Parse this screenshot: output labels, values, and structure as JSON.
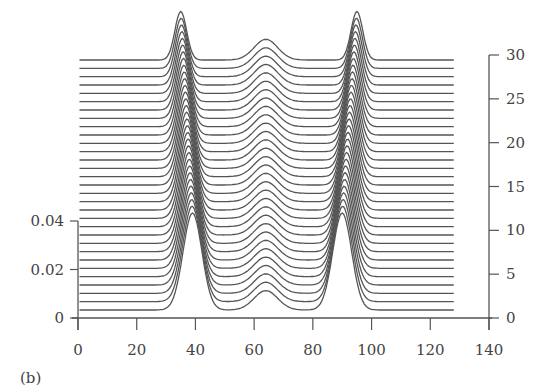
{
  "panel_label": "(b)",
  "chart_data": {
    "type": "line",
    "subtype": "waterfall",
    "title": "",
    "xlabel": "",
    "ylabel": "",
    "zlabel": "",
    "xlim": [
      0,
      140
    ],
    "x_ticks": [
      0,
      20,
      40,
      60,
      80,
      100,
      120,
      140
    ],
    "x_data_range": [
      0,
      128
    ],
    "ylim": [
      0,
      0.04
    ],
    "y_ticks": [
      "0",
      "0.02",
      "0.04"
    ],
    "zlim": [
      0,
      30
    ],
    "z_ticks": [
      0,
      5,
      10,
      15,
      20,
      25,
      30
    ],
    "grid": false,
    "legend": null,
    "n_traces": 31,
    "trace_offset_per_step": 1,
    "peaks": {
      "left": {
        "center_start": 39,
        "center_end": 35,
        "height_start": 0.04,
        "height_end": 0.02,
        "width_start": 3.2,
        "width_end": 2.0
      },
      "center": {
        "center": 64,
        "height_start": 0.008,
        "height_end": 0.0085,
        "width": 4.0
      },
      "right": {
        "center_start": 90,
        "center_end": 95,
        "height_start": 0.04,
        "height_end": 0.02,
        "width_start": 3.2,
        "width_end": 2.0
      }
    },
    "line_color": "#555555"
  }
}
